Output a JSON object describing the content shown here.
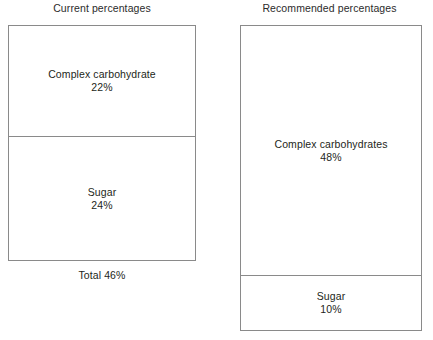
{
  "chart_data": {
    "type": "bar",
    "title": "",
    "xlabel": "",
    "ylabel": "",
    "legend": "none",
    "grid": false,
    "orientation": "stacked-vertical",
    "unit": "%",
    "note": "Two schematic stacked boxes comparing current versus recommended dietary carbohydrate and sugar percentages. Box segment heights are schematic and not drawn to scale with the values.",
    "panels": [
      {
        "name": "current",
        "title": "Current percentages",
        "categories": [
          "Complex carbohydrate",
          "Sugar"
        ],
        "values": [
          22,
          24
        ],
        "labels": [
          "22%",
          "24%"
        ],
        "total": 46,
        "caption": "Total 46%"
      },
      {
        "name": "recommended",
        "title": "Recommended percentages",
        "categories": [
          "Complex carbohydrates",
          "Sugar"
        ],
        "values": [
          48,
          10
        ],
        "labels": [
          "48%",
          "10%"
        ],
        "total": 58,
        "caption": ""
      }
    ]
  },
  "figure": {
    "panels": {
      "current": {
        "title": "Current percentages",
        "segments": [
          {
            "label": "Complex carbohydrate",
            "value": "22%"
          },
          {
            "label": "Sugar",
            "value": "24%"
          }
        ],
        "caption": "Total 46%"
      },
      "recommended": {
        "title": "Recommended percentages",
        "segments": [
          {
            "label": "Complex carbohydrates",
            "value": "48%"
          },
          {
            "label": "Sugar",
            "value": "10%"
          }
        ],
        "caption": ""
      }
    }
  },
  "colors": {
    "background": "#ffffff",
    "stroke": "#8a8a8a",
    "text": "#231f20"
  }
}
